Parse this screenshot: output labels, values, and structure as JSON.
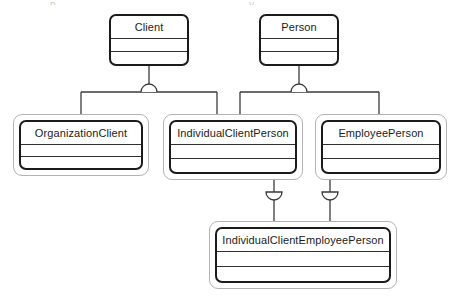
{
  "diagram": {
    "type": "uml-class-diagram",
    "background_color": "#ffffff",
    "frame_color": "#b3b3b3",
    "border_color": "#1b1b1b",
    "line_color": "#3a3a3a",
    "top_artifacts": [
      {
        "text": "p",
        "x": 50,
        "width": 12
      },
      {
        "text": "y",
        "x": 249,
        "width": 12
      }
    ],
    "nodes": [
      {
        "id": "client",
        "name": "Client",
        "x": 109,
        "y": 14,
        "width": 80,
        "height": 52,
        "framed": false,
        "compartments": [
          "attributes",
          "operations"
        ]
      },
      {
        "id": "person",
        "name": "Person",
        "x": 259,
        "y": 14,
        "width": 80,
        "height": 52,
        "framed": false,
        "compartments": [
          "attributes",
          "operations"
        ]
      },
      {
        "id": "organization-client",
        "name": "OrganizationClient",
        "x": 13,
        "y": 114,
        "width": 136,
        "height": 62,
        "framed": true,
        "compartments": [
          "attributes",
          "operations"
        ]
      },
      {
        "id": "individual-client-person",
        "name": "IndividualClientPerson",
        "x": 163,
        "y": 114,
        "width": 140,
        "height": 66,
        "framed": true,
        "compartments": [
          "attributes",
          "operations"
        ]
      },
      {
        "id": "employee-person",
        "name": "EmployeePerson",
        "x": 315,
        "y": 114,
        "width": 132,
        "height": 66,
        "framed": true,
        "compartments": [
          "attributes",
          "operations"
        ]
      },
      {
        "id": "individual-client-employee-person",
        "name": "IndividualClientEmployeePerson",
        "x": 209,
        "y": 221,
        "width": 188,
        "height": 68,
        "framed": true,
        "compartments": [
          "attributes",
          "operations"
        ]
      }
    ],
    "generalization_sets": [
      {
        "id": "client-gs",
        "parent": "Client",
        "children": [
          "OrganizationClient",
          "IndividualClientPerson"
        ],
        "constraint_marker": "semicircle-arc",
        "marker_position": "on-branch-bar"
      },
      {
        "id": "person-gs",
        "parent": "Person",
        "children": [
          "IndividualClientPerson",
          "EmployeePerson"
        ],
        "constraint_marker": "semicircle-arc",
        "marker_position": "on-branch-bar"
      },
      {
        "id": "icp-to-icep",
        "parent": "IndividualClientPerson",
        "children": [
          "IndividualClientEmployeePerson"
        ],
        "constraint_marker": "semicircle-arc",
        "marker_position": "on-vertical-line"
      },
      {
        "id": "ep-to-icep",
        "parent": "EmployeePerson",
        "children": [
          "IndividualClientEmployeePerson"
        ],
        "constraint_marker": "semicircle-arc",
        "marker_position": "on-vertical-line"
      }
    ]
  }
}
